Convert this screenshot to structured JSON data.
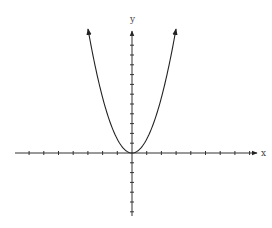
{
  "chart_data": {
    "type": "line",
    "title": "",
    "xlabel": "x",
    "ylabel": "y",
    "function": "y = x^2",
    "series": [
      {
        "name": "parabola",
        "x": [
          -3,
          -2.5,
          -2,
          -1.5,
          -1,
          -0.5,
          0,
          0.5,
          1,
          1.5,
          2,
          2.5,
          3
        ],
        "values": [
          9,
          6.25,
          4,
          2.25,
          1,
          0.25,
          0,
          0.25,
          1,
          2.25,
          4,
          6.25,
          9
        ]
      }
    ],
    "vertex": [
      0,
      0
    ],
    "xlim": [
      -8,
      8.5
    ],
    "ylim": [
      -6,
      12.5
    ],
    "x_ticks": [
      -7,
      -6,
      -5,
      -4,
      -3,
      -2,
      -1,
      1,
      2,
      3,
      4,
      5,
      6,
      7,
      8
    ],
    "y_ticks": [
      -6,
      -5,
      -4,
      -3,
      -2,
      -1,
      1,
      2,
      3,
      4,
      5,
      6,
      7,
      8,
      9,
      10,
      11,
      12
    ],
    "tick_labels_shown": false,
    "grid": false,
    "legend": null,
    "arrows": "axes and curve ends have arrowheads",
    "colors": {
      "axis": "#333333",
      "curve": "#222222",
      "background": "#ffffff"
    }
  },
  "axes": {
    "x_label": "x",
    "y_label": "y"
  }
}
